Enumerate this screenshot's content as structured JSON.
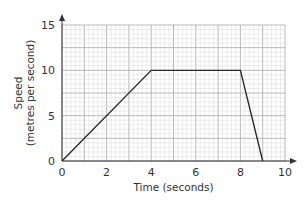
{
  "chart_data": {
    "type": "line",
    "title": "",
    "xlabel": "Time (seconds)",
    "ylabel_line1": "Speed",
    "ylabel_line2": "(metres per second)",
    "xlim": [
      0,
      10
    ],
    "ylim": [
      0,
      15
    ],
    "x_ticks": [
      0,
      2,
      4,
      6,
      8,
      10
    ],
    "y_ticks": [
      0,
      5,
      10,
      15
    ],
    "grid": true,
    "legend": null,
    "series": [
      {
        "name": "speed-time",
        "x": [
          0,
          4,
          8,
          9
        ],
        "y": [
          0,
          10,
          10,
          0
        ]
      }
    ]
  },
  "colors": {
    "line": "#2b2b2b",
    "axis": "#333333",
    "grid_minor": "#d8d8d8",
    "grid_major": "#a8a8a8"
  }
}
